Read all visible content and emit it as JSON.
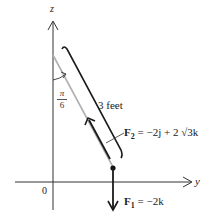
{
  "diagram": {
    "axes": {
      "vertical_label": "z",
      "horizontal_label": "y",
      "origin_label": "0"
    },
    "angle": {
      "numerator": "π",
      "denominator": "6"
    },
    "length_label": "3 feet",
    "forces": {
      "f2": {
        "name": "F",
        "subscript": "2",
        "expression": " = −2j + 2 √3k"
      },
      "f1": {
        "name": "F",
        "subscript": "1",
        "expression": " = −2k"
      }
    },
    "colors": {
      "ink": "#1a1a1a",
      "rod": "#b0b0b0"
    }
  }
}
